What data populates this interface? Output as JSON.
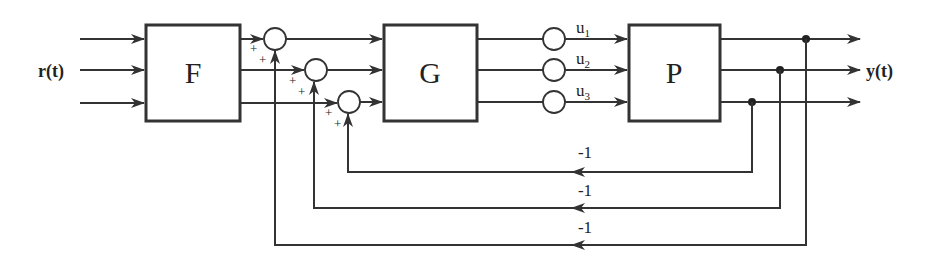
{
  "diagram": {
    "type": "block-diagram",
    "title": "",
    "input_label": "r(t)",
    "output_label": "y(t)",
    "blocks": [
      {
        "id": "F",
        "label": "F"
      },
      {
        "id": "G",
        "label": "G"
      },
      {
        "id": "P",
        "label": "P"
      }
    ],
    "summing_junctions": [
      {
        "id": "s1",
        "signs": [
          "+",
          "+"
        ]
      },
      {
        "id": "s2",
        "signs": [
          "+",
          "+"
        ]
      },
      {
        "id": "s3",
        "signs": [
          "+",
          "+"
        ]
      }
    ],
    "control_signals": [
      {
        "base": "u",
        "sub": "1"
      },
      {
        "base": "u",
        "sub": "2"
      },
      {
        "base": "u",
        "sub": "3"
      }
    ],
    "feedback_gains": [
      "-1",
      "-1",
      "-1"
    ],
    "colors": {
      "line": "#333333",
      "background": "#ffffff"
    }
  }
}
